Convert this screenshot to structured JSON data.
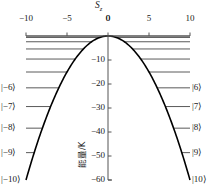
{
  "figure": {
    "title": "S",
    "title_sub": "z",
    "ylabel": "能量/K",
    "background": "#ffffff",
    "curve_color": "#000000",
    "level_color": "#5a5a5a",
    "axis_color": "#555555"
  },
  "chart_data": {
    "type": "line",
    "title": "Sz",
    "xlabel": "S_z",
    "ylabel": "能量/K",
    "xlim": [
      -10,
      10
    ],
    "ylim": [
      -60,
      0
    ],
    "grid": false,
    "legend": null,
    "xticks": [
      -10,
      -5,
      0,
      5,
      10
    ],
    "xticklabels": [
      "−10",
      "−5",
      "0",
      "5",
      "10"
    ],
    "yticks": [
      0,
      -10,
      -20,
      -30,
      -40,
      -50,
      -60
    ],
    "yticklabels": [
      "0",
      "−10",
      "−20",
      "−30",
      "−40",
      "−50",
      "−60"
    ],
    "series": [
      {
        "name": "parabolic envelope",
        "type": "line",
        "comment": "E = -0.6 * Sz^2 (K), apex at (0,0), endpoints at (±10,−60)",
        "x": [
          -10,
          -9,
          -8,
          -7,
          -6,
          -5,
          -4,
          -3,
          -2,
          -1,
          0,
          1,
          2,
          3,
          4,
          5,
          6,
          7,
          8,
          9,
          10
        ],
        "y": [
          -60,
          -48.6,
          -38.4,
          -29.4,
          -21.6,
          -15,
          -9.6,
          -5.4,
          -2.4,
          -0.6,
          0,
          -0.6,
          -2.4,
          -5.4,
          -9.6,
          -15,
          -21.6,
          -29.4,
          -38.4,
          -48.6,
          -60
        ]
      }
    ],
    "levels": [
      {
        "n": 0,
        "energy": 0,
        "label_left": null,
        "label_right": null
      },
      {
        "n": 1,
        "energy": -0.6,
        "label_left": null,
        "label_right": null
      },
      {
        "n": 2,
        "energy": -2.4,
        "label_left": null,
        "label_right": null
      },
      {
        "n": 3,
        "energy": -5.4,
        "label_left": null,
        "label_right": null
      },
      {
        "n": 4,
        "energy": -9.6,
        "label_left": null,
        "label_right": null
      },
      {
        "n": 5,
        "energy": -15.0,
        "label_left": null,
        "label_right": null
      },
      {
        "n": 6,
        "energy": -21.6,
        "label_left": "|−6⟩",
        "label_right": "|6⟩"
      },
      {
        "n": 7,
        "energy": -29.4,
        "label_left": "|−7⟩",
        "label_right": "|7⟩"
      },
      {
        "n": 8,
        "energy": -38.4,
        "label_left": "|−8⟩",
        "label_right": "|8⟩"
      },
      {
        "n": 9,
        "energy": -48.6,
        "label_left": "|−9⟩",
        "label_right": "|9⟩"
      },
      {
        "n": 10,
        "energy": -60.0,
        "label_left": "|−10⟩",
        "label_right": "|10⟩"
      }
    ]
  }
}
